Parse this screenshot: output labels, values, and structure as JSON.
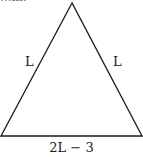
{
  "header": {
    "clipped_text": "...m:"
  },
  "diagram": {
    "shape": "isosceles-triangle",
    "stroke_color": "#1a1a1a",
    "vertices": {
      "apex": [
        72,
        3
      ],
      "bottom_left": [
        1,
        136
      ],
      "bottom_right": [
        142,
        136
      ]
    },
    "labels": {
      "left_side": "L",
      "right_side": "L",
      "base": "2L − 3"
    }
  }
}
